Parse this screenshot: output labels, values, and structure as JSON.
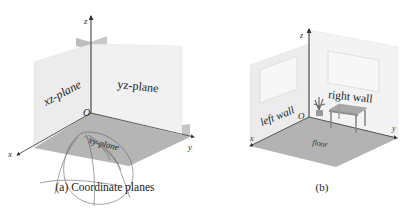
{
  "figure_a": {
    "caption": "(a) Coordinate planes",
    "axes": {
      "x": "x",
      "y": "y",
      "z": "z",
      "origin": "O"
    },
    "planes": {
      "xz": "xz-plane",
      "yz": "yz-plane",
      "xy": "xy-plane"
    }
  },
  "figure_b": {
    "caption": "(b)",
    "axes": {
      "x": "x",
      "y": "y",
      "z": "z",
      "origin": "O"
    },
    "labels": {
      "left_wall": "left wall",
      "right_wall": "right wall",
      "floor": "floor"
    }
  },
  "colors": {
    "wall": "#ececec",
    "wall_right": "#f2f2f2",
    "floor": "#b4b4b4",
    "small_plane": "#b8b8b8",
    "axis": "#333333",
    "window": "#f6f6f6",
    "table": "#9a9a9a",
    "scribble": "#555555"
  }
}
